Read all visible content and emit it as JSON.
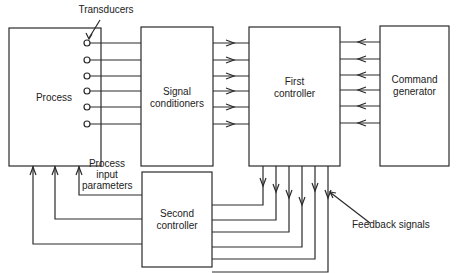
{
  "blocks": {
    "process": "Process",
    "signal_conditioners_l1": "Signal",
    "signal_conditioners_l2": "conditioners",
    "first_controller_l1": "First",
    "first_controller_l2": "controller",
    "command_generator_l1": "Command",
    "command_generator_l2": "generator",
    "second_controller_l1": "Second",
    "second_controller_l2": "controller"
  },
  "annotations": {
    "transducers": "Transducers",
    "process_input_l1": "Process",
    "process_input_l2": "input",
    "process_input_l3": "parameters",
    "feedback_signals": "Feedback signals"
  },
  "colors": {
    "line": "#2a2a2a",
    "background": "#ffffff"
  }
}
